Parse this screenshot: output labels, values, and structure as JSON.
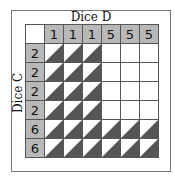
{
  "diagram": {
    "column_title": "Dice D",
    "row_title": "Dice C",
    "columns": [
      "1",
      "1",
      "1",
      "5",
      "5",
      "5"
    ],
    "rows": [
      "2",
      "2",
      "2",
      "2",
      "6",
      "6"
    ],
    "cells": [
      [
        "win",
        "win",
        "win",
        "",
        "",
        ""
      ],
      [
        "win",
        "win",
        "win",
        "",
        "",
        ""
      ],
      [
        "win",
        "win",
        "win",
        "",
        "",
        ""
      ],
      [
        "win",
        "win",
        "win",
        "",
        "",
        ""
      ],
      [
        "win",
        "win",
        "win",
        "win",
        "win",
        "win"
      ],
      [
        "win",
        "win",
        "win",
        "win",
        "win",
        "win"
      ]
    ],
    "colors": {
      "header": "#b8b8b8",
      "shade": "#555555",
      "grid": "#555555"
    }
  }
}
